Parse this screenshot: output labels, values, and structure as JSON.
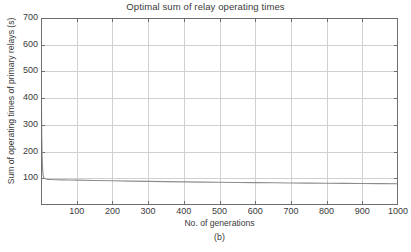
{
  "chart_data": {
    "type": "line",
    "title": "Optimal sum of relay operating times",
    "xlabel": "No. of generations",
    "ylabel": "Sum of operating times of primary relays (s)",
    "subcaption": "(b)",
    "xlim": [
      0,
      1000
    ],
    "ylim": [
      0,
      700
    ],
    "grid": true,
    "legend": "none",
    "line_color": "#8c8c8c",
    "axis_color": "#6e6e6e",
    "grid_color": "#d0d0d0",
    "background": "#ffffff",
    "xticks": [
      0,
      100,
      200,
      300,
      400,
      500,
      600,
      700,
      800,
      900,
      1000
    ],
    "xtick_labels": [
      "",
      "100",
      "200",
      "300",
      "400",
      "500",
      "600",
      "700",
      "800",
      "900",
      "1000"
    ],
    "yticks": [
      0,
      100,
      200,
      300,
      400,
      500,
      600,
      700
    ],
    "ytick_labels": [
      "",
      "100",
      "200",
      "300",
      "400",
      "500",
      "600",
      "700"
    ],
    "series": [
      {
        "name": "Optimal sum of relay operating times",
        "x": [
          0,
          1,
          2,
          3,
          4,
          5,
          6,
          8,
          10,
          15,
          20,
          30,
          40,
          60,
          80,
          100,
          150,
          200,
          250,
          300,
          350,
          400,
          450,
          500,
          550,
          600,
          650,
          700,
          750,
          800,
          850,
          900,
          950,
          1000
        ],
        "y": [
          700,
          430,
          268,
          190,
          148,
          124,
          112,
          103,
          99,
          97,
          96,
          95.2,
          94.6,
          94.0,
          93.5,
          93.0,
          91.8,
          90.6,
          89.5,
          88.4,
          87.4,
          86.5,
          85.7,
          85.0,
          84.3,
          83.7,
          83.1,
          82.5,
          82.0,
          81.5,
          81.0,
          80.5,
          80.0,
          79.6
        ]
      }
    ]
  }
}
